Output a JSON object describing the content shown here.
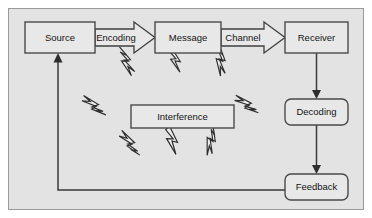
{
  "diagram": {
    "canvas": {
      "background_color": "#e3e3e3",
      "border_color": "#9a9a9a",
      "outer_margin_color": "#ffffff"
    },
    "nodes": [
      {
        "id": "source",
        "label": "Source",
        "shape": "rectangle",
        "x": 25,
        "y": 22,
        "w": 70,
        "h": 31
      },
      {
        "id": "message",
        "label": "Message",
        "shape": "rectangle",
        "x": 155,
        "y": 22,
        "w": 66,
        "h": 31
      },
      {
        "id": "receiver",
        "label": "Receiver",
        "shape": "rectangle",
        "x": 285,
        "y": 22,
        "w": 63,
        "h": 31
      },
      {
        "id": "interference",
        "label": "Interference",
        "shape": "rectangle",
        "x": 131,
        "y": 105,
        "w": 103,
        "h": 23
      },
      {
        "id": "decoding",
        "label": "Decoding",
        "shape": "rounded-rectangle",
        "x": 285,
        "y": 99,
        "w": 63,
        "h": 26
      },
      {
        "id": "feedback",
        "label": "Feedback",
        "shape": "rounded-rectangle",
        "x": 285,
        "y": 174,
        "w": 63,
        "h": 26
      }
    ],
    "block_arrows": [
      {
        "id": "encoding",
        "label": "Encoding",
        "from": "source",
        "to": "message",
        "direction": "right"
      },
      {
        "id": "channel",
        "label": "Channel",
        "from": "message",
        "to": "receiver",
        "direction": "right"
      }
    ],
    "connectors": [
      {
        "id": "receiver-to-decoding",
        "from": "receiver",
        "to": "decoding",
        "style": "arrow-down"
      },
      {
        "id": "decoding-to-feedback",
        "from": "decoding",
        "to": "feedback",
        "style": "arrow-down"
      },
      {
        "id": "feedback-to-source",
        "from": "feedback",
        "to": "source",
        "style": "elbow-arrow-up"
      }
    ],
    "noise_symbols": {
      "name": "lightning-bolt",
      "count": 8,
      "meaning": "interference noise",
      "positions": [
        {
          "id": "bolt-top-left",
          "x": 128,
          "y": 62,
          "rotate": 28
        },
        {
          "id": "bolt-top-center",
          "x": 175,
          "y": 60,
          "rotate": -4
        },
        {
          "id": "bolt-top-right",
          "x": 222,
          "y": 62,
          "rotate": 48
        },
        {
          "id": "bolt-mid-left",
          "x": 92,
          "y": 105,
          "rotate": 95
        },
        {
          "id": "bolt-mid-right",
          "x": 243,
          "y": 105,
          "rotate": 82
        },
        {
          "id": "bolt-bottom-left",
          "x": 128,
          "y": 142,
          "rotate": 118
        },
        {
          "id": "bolt-bottom-mid",
          "x": 172,
          "y": 140,
          "rotate": 2
        },
        {
          "id": "bolt-bottom-right",
          "x": 212,
          "y": 142,
          "rotate": 62
        }
      ]
    }
  }
}
